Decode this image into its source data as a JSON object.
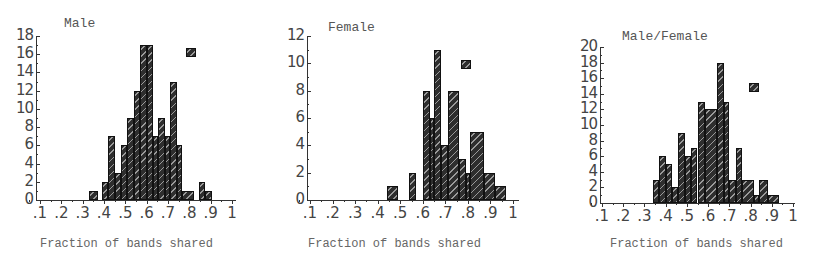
{
  "chart_data": [
    {
      "type": "bar",
      "title": "Male",
      "xlabel": "Fraction of bands shared",
      "ylabel": "",
      "xlim": [
        0,
        1
      ],
      "ylim": [
        0,
        18
      ],
      "xticks": [
        ".1",
        ".2",
        ".3",
        ".4",
        ".5",
        ".6",
        ".7",
        ".8",
        ".9",
        "1"
      ],
      "yticks": [
        "0",
        "2",
        "4",
        "6",
        "8",
        "10",
        "12",
        "14",
        "16",
        "18"
      ],
      "grid": false,
      "legend": "marker square top-right",
      "bins": [
        {
          "x0": 0.33,
          "x1": 0.37,
          "value": 1
        },
        {
          "x0": 0.39,
          "x1": 0.42,
          "value": 2
        },
        {
          "x0": 0.42,
          "x1": 0.45,
          "value": 7
        },
        {
          "x0": 0.45,
          "x1": 0.48,
          "value": 3
        },
        {
          "x0": 0.48,
          "x1": 0.51,
          "value": 6
        },
        {
          "x0": 0.51,
          "x1": 0.54,
          "value": 9
        },
        {
          "x0": 0.54,
          "x1": 0.57,
          "value": 12
        },
        {
          "x0": 0.57,
          "x1": 0.6,
          "value": 17
        },
        {
          "x0": 0.6,
          "x1": 0.63,
          "value": 17
        },
        {
          "x0": 0.63,
          "x1": 0.655,
          "value": 7
        },
        {
          "x0": 0.655,
          "x1": 0.685,
          "value": 9
        },
        {
          "x0": 0.685,
          "x1": 0.71,
          "value": 7
        },
        {
          "x0": 0.71,
          "x1": 0.74,
          "value": 13
        },
        {
          "x0": 0.74,
          "x1": 0.765,
          "value": 6
        },
        {
          "x0": 0.765,
          "x1": 0.82,
          "value": 1
        },
        {
          "x0": 0.845,
          "x1": 0.875,
          "value": 2
        },
        {
          "x0": 0.875,
          "x1": 0.905,
          "value": 1
        }
      ]
    },
    {
      "type": "bar",
      "title": "Female",
      "xlabel": "Fraction of bands shared",
      "ylabel": "",
      "xlim": [
        0,
        1
      ],
      "ylim": [
        0,
        12
      ],
      "xticks": [
        ".1",
        ".2",
        ".3",
        ".4",
        ".5",
        ".6",
        ".7",
        ".8",
        ".9",
        "1"
      ],
      "yticks": [
        "0",
        "2",
        "4",
        "6",
        "8",
        "10",
        "12"
      ],
      "grid": false,
      "legend": "marker square top-right",
      "bins": [
        {
          "x0": 0.44,
          "x1": 0.49,
          "value": 1
        },
        {
          "x0": 0.54,
          "x1": 0.57,
          "value": 2
        },
        {
          "x0": 0.6,
          "x1": 0.63,
          "value": 8
        },
        {
          "x0": 0.63,
          "x1": 0.65,
          "value": 6
        },
        {
          "x0": 0.65,
          "x1": 0.68,
          "value": 11
        },
        {
          "x0": 0.68,
          "x1": 0.71,
          "value": 4
        },
        {
          "x0": 0.71,
          "x1": 0.76,
          "value": 8
        },
        {
          "x0": 0.76,
          "x1": 0.79,
          "value": 3
        },
        {
          "x0": 0.79,
          "x1": 0.81,
          "value": 2
        },
        {
          "x0": 0.81,
          "x1": 0.87,
          "value": 5
        },
        {
          "x0": 0.87,
          "x1": 0.92,
          "value": 2
        },
        {
          "x0": 0.92,
          "x1": 0.97,
          "value": 1
        }
      ]
    },
    {
      "type": "bar",
      "title": "Male/Female",
      "xlabel": "Fraction of bands shared",
      "ylabel": "",
      "xlim": [
        0,
        1
      ],
      "ylim": [
        0,
        20
      ],
      "xticks": [
        ".1",
        ".2",
        ".3",
        ".4",
        ".5",
        ".6",
        ".7",
        ".8",
        ".9",
        "1"
      ],
      "yticks": [
        "0",
        "2",
        "4",
        "6",
        "8",
        "10",
        "12",
        "14",
        "16",
        "18",
        "20"
      ],
      "grid": false,
      "legend": "marker square top-right",
      "bins": [
        {
          "x0": 0.34,
          "x1": 0.37,
          "value": 3
        },
        {
          "x0": 0.37,
          "x1": 0.4,
          "value": 6
        },
        {
          "x0": 0.4,
          "x1": 0.43,
          "value": 5
        },
        {
          "x0": 0.43,
          "x1": 0.46,
          "value": 2
        },
        {
          "x0": 0.46,
          "x1": 0.49,
          "value": 9
        },
        {
          "x0": 0.49,
          "x1": 0.52,
          "value": 6
        },
        {
          "x0": 0.52,
          "x1": 0.55,
          "value": 7
        },
        {
          "x0": 0.55,
          "x1": 0.585,
          "value": 13
        },
        {
          "x0": 0.585,
          "x1": 0.64,
          "value": 12
        },
        {
          "x0": 0.64,
          "x1": 0.675,
          "value": 18
        },
        {
          "x0": 0.675,
          "x1": 0.7,
          "value": 13
        },
        {
          "x0": 0.7,
          "x1": 0.73,
          "value": 3
        },
        {
          "x0": 0.73,
          "x1": 0.76,
          "value": 7
        },
        {
          "x0": 0.76,
          "x1": 0.815,
          "value": 3
        },
        {
          "x0": 0.815,
          "x1": 0.84,
          "value": 1
        },
        {
          "x0": 0.84,
          "x1": 0.88,
          "value": 3
        },
        {
          "x0": 0.88,
          "x1": 0.935,
          "value": 1
        }
      ]
    }
  ],
  "panels": [
    {
      "title": "Male",
      "xlabel": "Fraction of bands shared"
    },
    {
      "title": "Female",
      "xlabel": "Fraction of bands shared"
    },
    {
      "title": "Male/Female",
      "xlabel": "Fraction of bands shared"
    }
  ]
}
